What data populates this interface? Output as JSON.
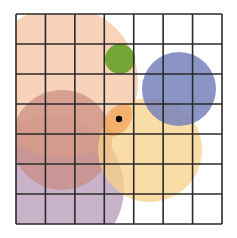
{
  "diagram": {
    "type": "grid-with-circles",
    "grid": {
      "rows": 7,
      "cols": 7,
      "x0": 16,
      "y0": 14,
      "x1": 222,
      "y1": 224,
      "line_color": "#2a2a2a",
      "line_width": 1.6
    },
    "circles": [
      {
        "name": "purple-circle",
        "cx": 52,
        "cy": 188,
        "r": 72,
        "color": "#b79ab8",
        "opacity": 0.75
      },
      {
        "name": "peach-circle",
        "cx": 62,
        "cy": 82,
        "r": 76,
        "color": "#f6c3a2",
        "opacity": 0.75
      },
      {
        "name": "red-circle",
        "cx": 62,
        "cy": 140,
        "r": 50,
        "color": "#c98a80",
        "opacity": 0.7
      },
      {
        "name": "yellow-circle",
        "cx": 150,
        "cy": 150,
        "r": 52,
        "color": "#f8d08a",
        "opacity": 0.75
      },
      {
        "name": "blue-circle",
        "cx": 179,
        "cy": 89,
        "r": 37,
        "color": "#7682bb",
        "opacity": 0.85
      },
      {
        "name": "green-circle",
        "cx": 120,
        "cy": 59,
        "r": 15,
        "color": "#6ea22c",
        "opacity": 0.95
      }
    ],
    "highlight": {
      "name": "orange-overlap-highlight",
      "cx": 118,
      "cy": 120,
      "rx": 12,
      "ry": 18,
      "rotate": 35,
      "color": "#f2a25a",
      "opacity": 0.7
    },
    "point": {
      "name": "black-dot",
      "cx": 119,
      "cy": 119,
      "r": 3.2,
      "color": "#000000"
    }
  }
}
